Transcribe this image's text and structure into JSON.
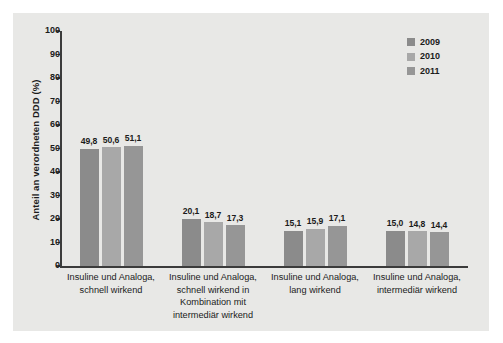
{
  "chart_data": {
    "type": "bar",
    "title": "",
    "xlabel": "",
    "ylabel": "Anteil an verordneten DDD (%)",
    "ylim": [
      0,
      100
    ],
    "ytick_step": 10,
    "yticks": [
      100,
      90,
      80,
      70,
      60,
      50,
      40,
      30,
      20,
      10,
      0
    ],
    "grid": false,
    "legend_position": "top-right",
    "categories": [
      "Insuline und Analoga, schnell wirkend",
      "Insuline und Analoga, schnell wirkend in Kombination mit intermediär wirkend",
      "Insuline und Analoga, lang wirkend",
      "Insuline und Analoga, intermediär wirkend"
    ],
    "category_lines": [
      [
        "Insuline und Analoga,",
        "schnell wirkend"
      ],
      [
        "Insuline und Analoga,",
        "schnell wirkend in",
        "Kombination mit",
        "intermediär wirkend"
      ],
      [
        "Insuline und Analoga,",
        "lang wirkend"
      ],
      [
        "Insuline und Analoga,",
        "intermediär wirkend"
      ]
    ],
    "series": [
      {
        "name": "2009",
        "color": "#8b8b8b",
        "values": [
          49.8,
          20.1,
          15.1,
          15.0
        ],
        "labels": [
          "49,8",
          "20,1",
          "15,1",
          "15,0"
        ]
      },
      {
        "name": "2010",
        "color": "#a8a8a8",
        "values": [
          50.6,
          18.7,
          15.9,
          14.8
        ],
        "labels": [
          "50,6",
          "18,7",
          "15,9",
          "14,8"
        ]
      },
      {
        "name": "2011",
        "color": "#969696",
        "values": [
          51.1,
          17.3,
          17.1,
          14.4
        ],
        "labels": [
          "51,1",
          "17,3",
          "17,1",
          "14,4"
        ]
      }
    ]
  },
  "style": {
    "panel_background": "#e8e8e6",
    "figure_background": "#ffffff",
    "axis_color": "#3b3b3b",
    "text_color": "#1b1b1b"
  }
}
